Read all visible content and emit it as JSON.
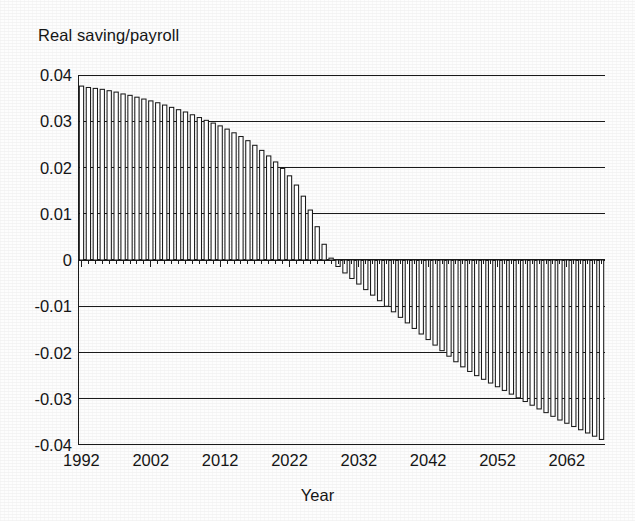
{
  "figure": {
    "y_axis_title": "Real saving/payroll",
    "x_axis_title": "Year",
    "ink_color": "#1a1a1a",
    "background_color": "#fdfdfd"
  },
  "chart_data": {
    "type": "bar",
    "title": "Real saving/payroll",
    "xlabel": "Year",
    "ylabel": "Real saving/payroll",
    "xlim": [
      1991.5,
      2067.5
    ],
    "ylim": [
      -0.04,
      0.04
    ],
    "grid": true,
    "legend": null,
    "ytick_labels": [
      "0.04",
      "0.03",
      "0.02",
      "0.01",
      "0",
      "-0.01",
      "-0.02",
      "-0.03",
      "-0.04"
    ],
    "ytick_values": [
      0.04,
      0.03,
      0.02,
      0.01,
      0,
      -0.01,
      -0.02,
      -0.03,
      -0.04
    ],
    "xtick_labels": [
      "1992",
      "2002",
      "2012",
      "2022",
      "2032",
      "2042",
      "2052",
      "2062"
    ],
    "xtick_values": [
      1992,
      2002,
      2012,
      2022,
      2032,
      2042,
      2052,
      2062
    ],
    "minor_xtick_step": 1,
    "bar_fill": "#ffffff",
    "bar_edge": "#1a1a1a",
    "categories": [
      1992,
      1993,
      1994,
      1995,
      1996,
      1997,
      1998,
      1999,
      2000,
      2001,
      2002,
      2003,
      2004,
      2005,
      2006,
      2007,
      2008,
      2009,
      2010,
      2011,
      2012,
      2013,
      2014,
      2015,
      2016,
      2017,
      2018,
      2019,
      2020,
      2021,
      2022,
      2023,
      2024,
      2025,
      2026,
      2027,
      2028,
      2029,
      2030,
      2031,
      2032,
      2033,
      2034,
      2035,
      2036,
      2037,
      2038,
      2039,
      2040,
      2041,
      2042,
      2043,
      2044,
      2045,
      2046,
      2047,
      2048,
      2049,
      2050,
      2051,
      2052,
      2053,
      2054,
      2055,
      2056,
      2057,
      2058,
      2059,
      2060,
      2061,
      2062,
      2063,
      2064,
      2065,
      2066,
      2067
    ],
    "values": [
      0.0376,
      0.0373,
      0.0371,
      0.0369,
      0.0366,
      0.0363,
      0.0359,
      0.0356,
      0.0352,
      0.0348,
      0.0344,
      0.034,
      0.0335,
      0.033,
      0.0325,
      0.032,
      0.0314,
      0.0308,
      0.0302,
      0.0296,
      0.029,
      0.0283,
      0.0275,
      0.0267,
      0.0258,
      0.0248,
      0.0237,
      0.0225,
      0.0212,
      0.0198,
      0.0182,
      0.0162,
      0.0138,
      0.0108,
      0.0072,
      0.0034,
      0.0004,
      -0.0014,
      -0.0028,
      -0.004,
      -0.0052,
      -0.0064,
      -0.0076,
      -0.0088,
      -0.01,
      -0.0112,
      -0.0124,
      -0.0136,
      -0.0148,
      -0.016,
      -0.0172,
      -0.0184,
      -0.0196,
      -0.0208,
      -0.022,
      -0.0231,
      -0.0241,
      -0.025,
      -0.0258,
      -0.0266,
      -0.0274,
      -0.0282,
      -0.029,
      -0.0298,
      -0.0306,
      -0.0314,
      -0.0322,
      -0.033,
      -0.0338,
      -0.0346,
      -0.0353,
      -0.036,
      -0.0367,
      -0.0374,
      -0.0381,
      -0.0388
    ]
  }
}
